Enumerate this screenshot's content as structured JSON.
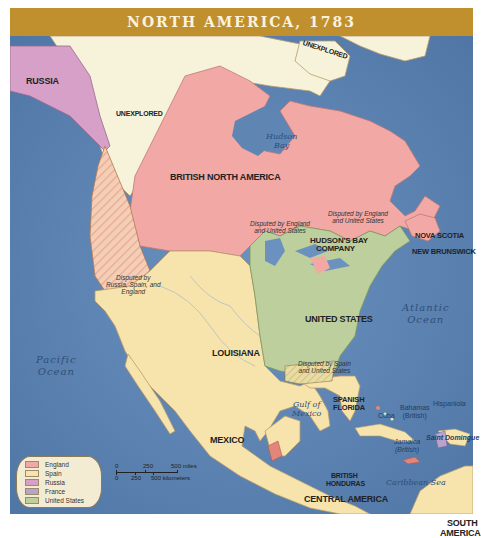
{
  "title": "NORTH AMERICA, 1783",
  "colors": {
    "title_bar": "#c0902f",
    "ocean": "#5f86b3",
    "england": "#f2a8a4",
    "spain": "#f7e4ad",
    "russia": "#d6a0c8",
    "france": "#b7a3cc",
    "united_states": "#bccf9c",
    "unexplored": "#f7f2da"
  },
  "regions": {
    "russia": "RUSSIA",
    "unexplored_west": "UNEXPLORED",
    "unexplored_north": "UNEXPLORED",
    "british_north_america": "BRITISH NORTH AMERICA",
    "hudsons_bay_company_1": "HUDSON'S BAY",
    "hudsons_bay_company_2": "COMPANY",
    "nova_scotia": "NOVA SCOTIA",
    "new_brunswick": "NEW BRUNSWICK",
    "united_states": "UNITED STATES",
    "louisiana": "LOUISIANA",
    "mexico": "MEXICO",
    "spanish_florida_1": "SPANISH",
    "spanish_florida_2": "FLORIDA",
    "british_honduras_1": "BRITISH",
    "british_honduras_2": "HONDURAS",
    "central_america": "CENTRAL AMERICA",
    "south_america_1": "SOUTH",
    "south_america_2": "AMERICA"
  },
  "annotations": {
    "disputed_oregon_1": "Disputed by",
    "disputed_oregon_2": "Russia, Spain, and",
    "disputed_oregon_3": "England",
    "disputed_lakes_1": "Disputed by England",
    "disputed_lakes_2": "and United States",
    "disputed_maine_1": "Disputed by England",
    "disputed_maine_2": "and United States",
    "disputed_south_1": "Disputed by Spain",
    "disputed_south_2": "and United States"
  },
  "water": {
    "hudson_bay_1": "Hudson",
    "hudson_bay_2": "Bay",
    "atlantic_1": "Atlantic",
    "atlantic_2": "Ocean",
    "pacific_1": "Pacific",
    "pacific_2": "Ocean",
    "gulf_1": "Gulf of",
    "gulf_2": "Mexico",
    "caribbean": "Caribbean Sea"
  },
  "islands": {
    "bahamas_1": "Bahamas",
    "bahamas_2": "(British)",
    "cuba": "Cuba",
    "hispaniola": "Hispaniola",
    "saint_domingue": "Saint Domingue",
    "jamaica_1": "Jamaica",
    "jamaica_2": "(British)"
  },
  "legend": {
    "items": [
      {
        "label": "England",
        "color": "#f2a8a4"
      },
      {
        "label": "Spain",
        "color": "#f7e4ad"
      },
      {
        "label": "Russia",
        "color": "#d6a0c8"
      },
      {
        "label": "France",
        "color": "#b7a3cc"
      },
      {
        "label": "United States",
        "color": "#bccf9c"
      }
    ]
  },
  "scale": {
    "miles_0": "0",
    "miles_250": "250",
    "miles_500": "500 miles",
    "km_0": "0",
    "km_250": "250",
    "km_500": "500 kilometers"
  }
}
